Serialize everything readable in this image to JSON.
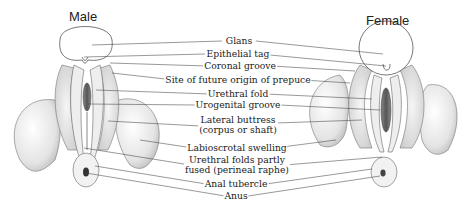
{
  "figure": {
    "left_title": "Male",
    "right_title": "Female",
    "labels": [
      {
        "text": "Glans"
      },
      {
        "text": "Epithelial tag"
      },
      {
        "text": "Coronal groove"
      },
      {
        "text": "Site of future origin of prepuce"
      },
      {
        "text": "Urethral fold"
      },
      {
        "text": "Urogenital groove"
      },
      {
        "text": "Lateral buttress",
        "text2": "(corpus or shaft)"
      },
      {
        "text": "Labioscrotal swelling"
      },
      {
        "text": "Urethral folds partly",
        "text2": "fused (perineal raphe)"
      },
      {
        "text": "Anal tubercle"
      },
      {
        "text": "Anus"
      }
    ]
  },
  "colors": {
    "ink": "#222222",
    "stipple": "#9a9a9a",
    "background": "#ffffff"
  }
}
